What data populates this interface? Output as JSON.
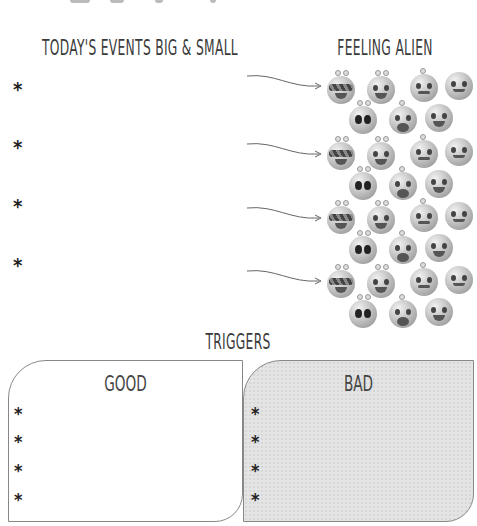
{
  "headings": {
    "events": "Today's Events Big & Small",
    "feeling": "Feeling alien",
    "triggers": "Triggers"
  },
  "events": {
    "bullets": [
      "*",
      "*",
      "*",
      "*"
    ]
  },
  "emoji_rows": [
    {
      "icons": [
        "cool-sunglasses-alien",
        "laughing-alien",
        "worried-alien",
        "sad-alien",
        "shocked-alien",
        "crying-alien",
        "angry-alien"
      ]
    },
    {
      "icons": [
        "cool-sunglasses-alien",
        "laughing-alien",
        "worried-alien",
        "sad-alien",
        "shocked-alien",
        "crying-alien",
        "angry-alien"
      ]
    },
    {
      "icons": [
        "cool-sunglasses-alien",
        "laughing-alien",
        "worried-alien",
        "sad-alien",
        "shocked-alien",
        "crying-alien",
        "angry-alien"
      ]
    },
    {
      "icons": [
        "cool-sunglasses-alien",
        "laughing-alien",
        "worried-alien",
        "sad-alien",
        "shocked-alien",
        "crying-alien",
        "angry-alien"
      ]
    }
  ],
  "triggers": {
    "good": {
      "title": "Good",
      "bullets": [
        "*",
        "*",
        "*",
        "*"
      ]
    },
    "bad": {
      "title": "Bad",
      "bullets": [
        "*",
        "*",
        "*",
        "*"
      ]
    }
  },
  "colors": {
    "text": "#3a3a3a",
    "bad_box_bg": "#e4e4e4",
    "border": "#888888"
  }
}
